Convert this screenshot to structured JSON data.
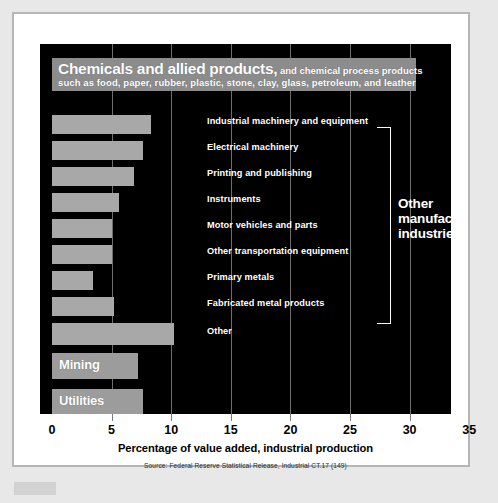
{
  "chart_data": {
    "type": "bar",
    "xlabel": "Percentage of value added, industrial production",
    "ylabel": "",
    "xlim": [
      0,
      35
    ],
    "xticks": [
      0,
      5,
      10,
      15,
      20,
      25,
      30,
      35
    ],
    "grid": true,
    "orientation": "horizontal",
    "legend": "none",
    "source": "Source: Federal Reserve Statistical Release, Industrial CT.17 (149)",
    "categories": [
      "Chemicals and allied products",
      "Industrial machinery and equipment",
      "Electrical machinery",
      "Printing and publishing",
      "Instruments",
      "Motor vehicles and parts",
      "Other transportation equipment",
      "Primary metals",
      "Fabricated metal products",
      "Other",
      "Mining",
      "Utilities"
    ],
    "values": [
      30.5,
      8.3,
      7.6,
      6.9,
      5.6,
      5.0,
      5.0,
      3.4,
      5.2,
      10.2,
      7.2,
      7.6
    ],
    "annotations": [
      {
        "text": "Other manufacturing industries",
        "covers": [
          "Industrial machinery and equipment",
          "Electrical machinery",
          "Printing and publishing",
          "Instruments",
          "Motor vehicles and parts",
          "Other transportation equipment",
          "Primary metals",
          "Fabricated metal products",
          "Other"
        ]
      }
    ],
    "colors": {
      "panel_background": "#000000",
      "bar_fill": "#a8a8a8",
      "header_bar_fill": "#8c8c8c",
      "category_bar_fill": "#9c9c9c",
      "gridline": "#6d6d6d",
      "label_text": "#ffffff",
      "axis_text": "#000000",
      "page_background": "#e8e8e8",
      "frame": "#ffffff",
      "frame_border": "#b6b6b6"
    }
  },
  "header": {
    "title_bold": "Chemicals and allied products,",
    "title_rest": " and chemical process products",
    "title_line2": "such as food, paper, rubber, plastic, stone, clay, glass, petroleum, and leather"
  },
  "series_labels": [
    "Industrial machinery and equipment",
    "Electrical machinery",
    "Printing and publishing",
    "Instruments",
    "Motor vehicles and parts",
    "Other transportation equipment",
    "Primary metals",
    "Fabricated metal products",
    "Other"
  ],
  "big_categories": {
    "mining": "Mining",
    "utilities": "Utilities"
  },
  "annotation": {
    "line1": "Other",
    "line2": "manufacturing",
    "line3": "industries"
  },
  "axis": {
    "ticks": [
      "0",
      "5",
      "10",
      "15",
      "20",
      "25",
      "30",
      "35"
    ],
    "title": "Percentage of value added, industrial production"
  },
  "footer": {
    "source": "Source: Federal Reserve Statistical Release, Industrial CT.17 (149)"
  }
}
